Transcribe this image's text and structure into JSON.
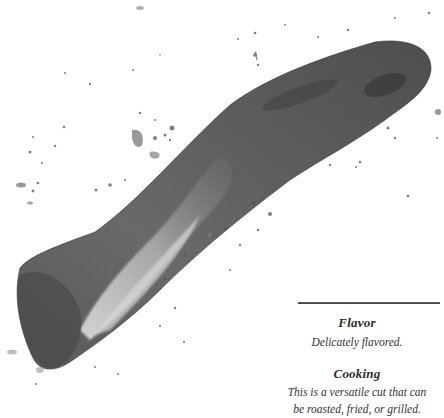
{
  "illustration": {
    "subject": "watercolor ink-wash illustration of a cut of meat",
    "style": "grayscale ink splash",
    "colors": {
      "dark": "#3c3c3c",
      "mid": "#6e6e6e",
      "light": "#bdbdbd",
      "background": "#ffffff"
    }
  },
  "sections": {
    "flavor": {
      "heading": "Flavor",
      "text": "Delicately flavored."
    },
    "cooking": {
      "heading": "Cooking",
      "text_line1": "This is a versatile cut that can",
      "text_line2": "be roasted, fried, or grilled."
    }
  }
}
